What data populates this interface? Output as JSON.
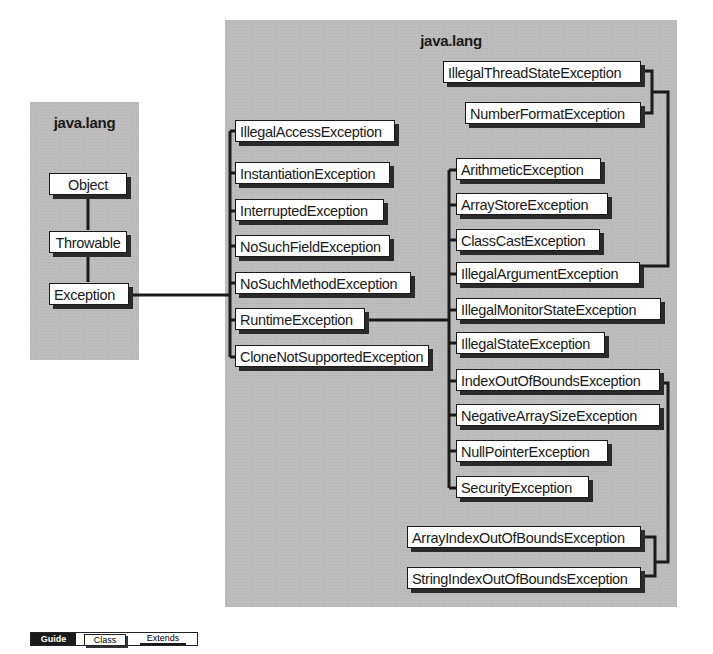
{
  "left_panel": {
    "title": "java.lang",
    "classes": [
      "Object",
      "Throwable",
      "Exception"
    ]
  },
  "right_panel": {
    "title": "java.lang",
    "exception_subclasses": [
      "IllegalAccessException",
      "InstantiationException",
      "InterruptedException",
      "NoSuchFieldException",
      "NoSuchMethodException",
      "RuntimeException",
      "CloneNotSupportedException"
    ],
    "runtime_subclasses": [
      "ArithmeticException",
      "ArrayStoreException",
      "ClassCastException",
      "IllegalArgumentException",
      "IllegalMonitorStateException",
      "IllegalStateException",
      "IndexOutOfBoundsException",
      "NegativeArraySizeException",
      "NullPointerException",
      "SecurityException"
    ],
    "illegal_argument_subclasses": [
      "IllegalThreadStateException",
      "NumberFormatException"
    ],
    "index_out_of_bounds_subclasses": [
      "ArrayIndexOutOfBoundsException",
      "StringIndexOutOfBoundsException"
    ]
  },
  "legend": {
    "guide": "Guide",
    "class": "Class",
    "extends": "Extends"
  },
  "colors": {
    "panel": "#bdbdbd",
    "box": "#ffffff",
    "line": "#1a1a1a"
  }
}
